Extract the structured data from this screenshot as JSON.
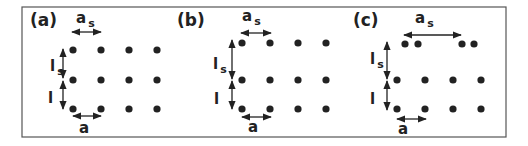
{
  "figure": {
    "frame": {
      "x": 22,
      "y": 7,
      "width": 484,
      "height": 130,
      "stroke": "#555555"
    },
    "dot_color": "#222222",
    "dot_radius": 3.6,
    "panels": [
      {
        "label": "(a)",
        "label_pos": [
          30,
          26
        ],
        "dots": [
          [
            73,
            50
          ],
          [
            101,
            50
          ],
          [
            129,
            50
          ],
          [
            157,
            50
          ],
          [
            73,
            80
          ],
          [
            101,
            80
          ],
          [
            129,
            80
          ],
          [
            157,
            80
          ],
          [
            73,
            109
          ],
          [
            101,
            109
          ],
          [
            129,
            109
          ],
          [
            157,
            109
          ]
        ],
        "as_label": "a",
        "as_sub": "s",
        "as_pos": [
          76,
          23
        ],
        "as_arrow": [
          72,
          101,
          32
        ],
        "ls_label": "l",
        "ls_sub": "s",
        "ls_pos": [
          50,
          71
        ],
        "ls_arrow": [
          63,
          49,
          78
        ],
        "l_label": "l",
        "l_pos": [
          48,
          103
        ],
        "l_arrow": [
          63,
          81,
          109
        ],
        "a_label": "a",
        "a_pos": [
          79,
          133
        ],
        "a_arrow": [
          73,
          101,
          116
        ]
      },
      {
        "label": "(b)",
        "label_pos": [
          177,
          26
        ],
        "dots": [
          [
            242,
            43
          ],
          [
            270,
            43
          ],
          [
            298,
            43
          ],
          [
            326,
            43
          ],
          [
            242,
            80
          ],
          [
            270,
            80
          ],
          [
            298,
            80
          ],
          [
            326,
            80
          ],
          [
            242,
            109
          ],
          [
            270,
            109
          ],
          [
            298,
            109
          ],
          [
            326,
            109
          ]
        ],
        "as_label": "a",
        "as_sub": "s",
        "as_pos": [
          242,
          21
        ],
        "as_arrow": [
          241,
          271,
          33
        ],
        "ls_label": "l",
        "ls_sub": "s",
        "ls_pos": [
          213,
          69
        ],
        "ls_arrow": [
          232,
          40,
          79
        ],
        "l_label": "l",
        "l_pos": [
          214,
          104
        ],
        "l_arrow": [
          232,
          81,
          109
        ],
        "a_label": "a",
        "a_pos": [
          248,
          132
        ],
        "a_arrow": [
          242,
          271,
          117
        ]
      },
      {
        "label": "(c)",
        "label_pos": [
          353,
          26
        ],
        "dots": [
          [
            405,
            44
          ],
          [
            418,
            44
          ],
          [
            462,
            44
          ],
          [
            474,
            44
          ],
          [
            397,
            80
          ],
          [
            425,
            80
          ],
          [
            453,
            80
          ],
          [
            481,
            80
          ],
          [
            397,
            109
          ],
          [
            425,
            109
          ],
          [
            453,
            109
          ],
          [
            481,
            109
          ]
        ],
        "as_label": "a",
        "as_sub": "s",
        "as_pos": [
          415,
          23
        ],
        "as_arrow": [
          404,
          461,
          35
        ],
        "ls_label": "l",
        "ls_sub": "s",
        "ls_pos": [
          370,
          64
        ],
        "ls_arrow": [
          387,
          42,
          79
        ],
        "l_label": "l",
        "l_pos": [
          370,
          104
        ],
        "l_arrow": [
          387,
          81,
          110
        ],
        "a_label": "a",
        "a_pos": [
          398,
          134
        ],
        "a_arrow": [
          397,
          426,
          119
        ]
      }
    ]
  }
}
